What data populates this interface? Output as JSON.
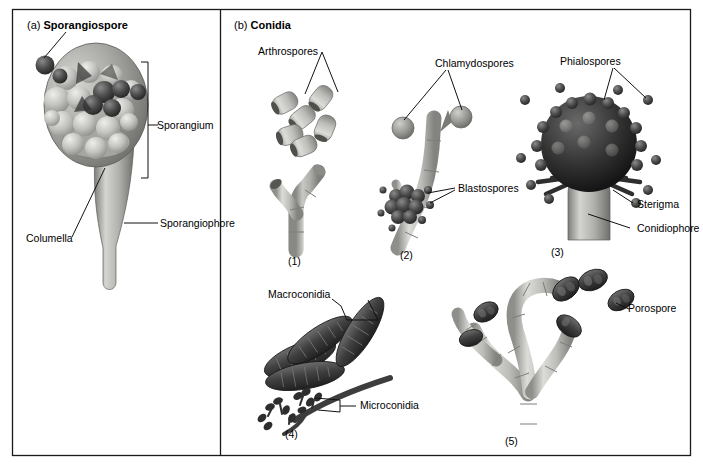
{
  "figure": {
    "panels": [
      {
        "id": "a",
        "tag": "(a)",
        "title": "Sporangiospore",
        "labels": [
          {
            "name": "sporangiospore",
            "text": "Sporangiospore"
          },
          {
            "name": "sporangium",
            "text": "Sporangium"
          },
          {
            "name": "sporangiophore",
            "text": "Sporangiophore"
          },
          {
            "name": "columella",
            "text": "Columella"
          }
        ]
      },
      {
        "id": "b",
        "tag": "(b)",
        "title": "Conidia",
        "labels": [
          {
            "name": "arthrospores",
            "text": "Arthrospores"
          },
          {
            "name": "chlamydospores",
            "text": "Chlamydospores"
          },
          {
            "name": "phialospores",
            "text": "Phialospores"
          },
          {
            "name": "blastospores",
            "text": "Blastospores"
          },
          {
            "name": "sterigma",
            "text": "Sterigma"
          },
          {
            "name": "conidiophore",
            "text": "Conidiophore"
          },
          {
            "name": "macroconidia",
            "text": "Macroconidia"
          },
          {
            "name": "microconidia",
            "text": "Microconidia"
          },
          {
            "name": "porospore",
            "text": "Porospore"
          }
        ],
        "numbers": [
          {
            "name": "structure-1",
            "text": "(1)"
          },
          {
            "name": "structure-2",
            "text": "(2)"
          },
          {
            "name": "structure-3",
            "text": "(3)"
          },
          {
            "name": "structure-4",
            "text": "(4)"
          },
          {
            "name": "structure-5",
            "text": "(5)"
          }
        ]
      }
    ],
    "colors": {
      "border": "#1a1a1a",
      "background": "#ffffff",
      "text": "#000000",
      "hypha_light": "#d8d8d4",
      "hypha_mid": "#a8a8a4",
      "hypha_dark": "#6e6e6c",
      "spore_dark": "#3a3a3a",
      "spore_mid": "#6a6a6a",
      "spore_light": "#c6c6c2"
    }
  }
}
